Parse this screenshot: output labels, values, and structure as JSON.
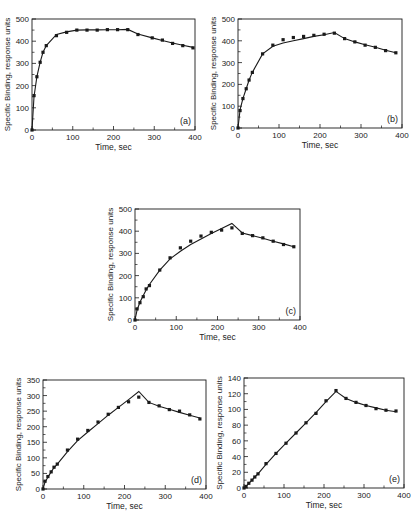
{
  "figure": {
    "common": {
      "xlabel": "Time, sec",
      "ylabel": "Specific Binding, response units",
      "line_color": "#1a1a1a",
      "marker_color": "#1a1a1a",
      "background": "#ffffff"
    }
  },
  "chart_data": [
    {
      "id": "a",
      "type": "line",
      "panel_label": "(a)",
      "title": "",
      "xlabel": "Time, sec",
      "ylabel": "Specific Binding, response units",
      "xlim": [
        0,
        400
      ],
      "ylim": [
        0,
        500
      ],
      "xticks": [
        0,
        100,
        200,
        300,
        400
      ],
      "yticks": [
        0,
        100,
        200,
        300,
        400,
        500
      ],
      "grid": false,
      "legend": "none",
      "box": {
        "left": 32,
        "top": 19,
        "right": 195,
        "bottom": 130
      },
      "series": [
        {
          "name": "experimental",
          "style": "markers",
          "x": [
            0,
            5,
            12,
            20,
            27,
            35,
            60,
            85,
            110,
            135,
            160,
            185,
            210,
            235,
            260,
            295,
            320,
            345,
            370,
            395
          ],
          "y": [
            0,
            155,
            240,
            305,
            350,
            380,
            425,
            440,
            450,
            450,
            450,
            452,
            452,
            452,
            430,
            415,
            405,
            390,
            380,
            370
          ]
        },
        {
          "name": "model fit",
          "style": "line",
          "x": [
            0,
            5,
            12,
            20,
            27,
            35,
            60,
            85,
            110,
            135,
            160,
            185,
            210,
            235,
            260,
            295,
            320,
            345,
            370,
            395
          ],
          "y": [
            0,
            150,
            240,
            305,
            350,
            380,
            430,
            442,
            450,
            451,
            451,
            452,
            452,
            453,
            432,
            415,
            403,
            392,
            382,
            372
          ]
        }
      ]
    },
    {
      "id": "b",
      "type": "line",
      "panel_label": "(b)",
      "title": "",
      "xlabel": "Time, sec",
      "ylabel": "Specific Binding, response units",
      "xlim": [
        0,
        400
      ],
      "ylim": [
        0,
        500
      ],
      "xticks": [
        0,
        100,
        200,
        300,
        400
      ],
      "yticks": [
        0,
        100,
        200,
        300,
        400,
        500
      ],
      "grid": false,
      "legend": "none",
      "box": {
        "left": 238,
        "top": 19,
        "right": 402,
        "bottom": 128
      },
      "series": [
        {
          "name": "experimental",
          "style": "markers",
          "x": [
            0,
            5,
            12,
            20,
            27,
            35,
            60,
            85,
            110,
            135,
            160,
            185,
            210,
            235,
            260,
            285,
            310,
            335,
            360,
            385
          ],
          "y": [
            0,
            80,
            135,
            180,
            220,
            255,
            340,
            380,
            405,
            415,
            420,
            425,
            430,
            435,
            410,
            395,
            380,
            370,
            355,
            345
          ]
        },
        {
          "name": "model fit",
          "style": "line",
          "x": [
            0,
            5,
            12,
            20,
            27,
            35,
            60,
            85,
            110,
            135,
            160,
            185,
            210,
            235,
            260,
            285,
            310,
            335,
            360,
            385
          ],
          "y": [
            0,
            85,
            135,
            180,
            220,
            255,
            340,
            375,
            390,
            400,
            410,
            420,
            428,
            438,
            410,
            395,
            382,
            370,
            357,
            345
          ]
        }
      ]
    },
    {
      "id": "c",
      "type": "line",
      "panel_label": "(c)",
      "title": "",
      "xlabel": "Time, sec",
      "ylabel": "Specific Binding, response units",
      "xlim": [
        0,
        400
      ],
      "ylim": [
        0,
        500
      ],
      "xticks": [
        0,
        100,
        200,
        300,
        400
      ],
      "yticks": [
        0,
        100,
        200,
        300,
        400,
        500
      ],
      "grid": false,
      "legend": "none",
      "box": {
        "left": 135,
        "top": 209,
        "right": 300,
        "bottom": 320
      },
      "series": [
        {
          "name": "experimental",
          "style": "markers",
          "x": [
            0,
            5,
            12,
            20,
            27,
            35,
            60,
            85,
            110,
            135,
            160,
            185,
            210,
            235,
            260,
            285,
            310,
            335,
            360,
            385
          ],
          "y": [
            0,
            50,
            78,
            105,
            140,
            155,
            225,
            280,
            325,
            355,
            378,
            395,
            405,
            415,
            390,
            380,
            370,
            355,
            340,
            330
          ]
        },
        {
          "name": "model fit",
          "style": "line",
          "x": [
            0,
            5,
            12,
            20,
            27,
            35,
            60,
            85,
            110,
            135,
            160,
            185,
            210,
            235,
            260,
            285,
            310,
            335,
            360,
            385
          ],
          "y": [
            0,
            45,
            80,
            110,
            135,
            160,
            225,
            275,
            310,
            340,
            365,
            390,
            412,
            435,
            392,
            380,
            368,
            355,
            343,
            330
          ]
        }
      ]
    },
    {
      "id": "d",
      "type": "line",
      "panel_label": "(d)",
      "title": "",
      "xlabel": "Time, sec",
      "ylabel": "Specific Binding, response units",
      "xlim": [
        0,
        400
      ],
      "ylim": [
        0,
        350
      ],
      "xticks": [
        0,
        100,
        200,
        300,
        400
      ],
      "yticks": [
        0,
        50,
        100,
        150,
        200,
        250,
        300,
        350
      ],
      "grid": false,
      "legend": "none",
      "box": {
        "left": 43,
        "top": 380,
        "right": 206,
        "bottom": 489
      },
      "series": [
        {
          "name": "experimental",
          "style": "markers",
          "x": [
            0,
            5,
            12,
            20,
            27,
            35,
            60,
            85,
            110,
            135,
            160,
            185,
            210,
            235,
            260,
            285,
            310,
            335,
            360,
            385
          ],
          "y": [
            0,
            25,
            40,
            55,
            70,
            80,
            125,
            160,
            188,
            215,
            240,
            262,
            280,
            295,
            278,
            267,
            255,
            250,
            238,
            225
          ]
        },
        {
          "name": "model fit",
          "style": "line",
          "x": [
            0,
            5,
            12,
            20,
            27,
            35,
            60,
            85,
            110,
            135,
            160,
            185,
            210,
            235,
            260,
            285,
            310,
            335,
            360,
            385
          ],
          "y": [
            0,
            22,
            38,
            55,
            68,
            80,
            120,
            155,
            183,
            210,
            237,
            262,
            287,
            313,
            278,
            266,
            256,
            246,
            237,
            228
          ]
        }
      ]
    },
    {
      "id": "e",
      "type": "line",
      "panel_label": "(e)",
      "title": "",
      "xlabel": "Time, sec",
      "ylabel": "Specific Binding, response units",
      "xlim": [
        0,
        400
      ],
      "ylim": [
        0,
        140
      ],
      "xticks": [
        0,
        100,
        200,
        300,
        400
      ],
      "yticks": [
        0,
        20,
        40,
        60,
        80,
        100,
        120,
        140
      ],
      "grid": false,
      "legend": "none",
      "box": {
        "left": 244,
        "top": 378,
        "right": 404,
        "bottom": 488
      },
      "series": [
        {
          "name": "experimental",
          "style": "markers",
          "x": [
            0,
            5,
            12,
            20,
            27,
            35,
            55,
            80,
            105,
            130,
            155,
            180,
            205,
            230,
            255,
            280,
            305,
            330,
            355,
            380
          ],
          "y": [
            0,
            2,
            6,
            10,
            14,
            18,
            31,
            44,
            57,
            70,
            83,
            95,
            111,
            124,
            114,
            109,
            105,
            101,
            99,
            98
          ]
        },
        {
          "name": "model fit",
          "style": "line",
          "x": [
            0,
            5,
            12,
            20,
            27,
            35,
            55,
            80,
            105,
            130,
            155,
            180,
            205,
            230,
            255,
            280,
            305,
            330,
            355,
            380
          ],
          "y": [
            0,
            2,
            6,
            10,
            14,
            18,
            30,
            44,
            57,
            70,
            83,
            96,
            110,
            123,
            114,
            109,
            105,
            102,
            99,
            97
          ]
        }
      ]
    }
  ]
}
